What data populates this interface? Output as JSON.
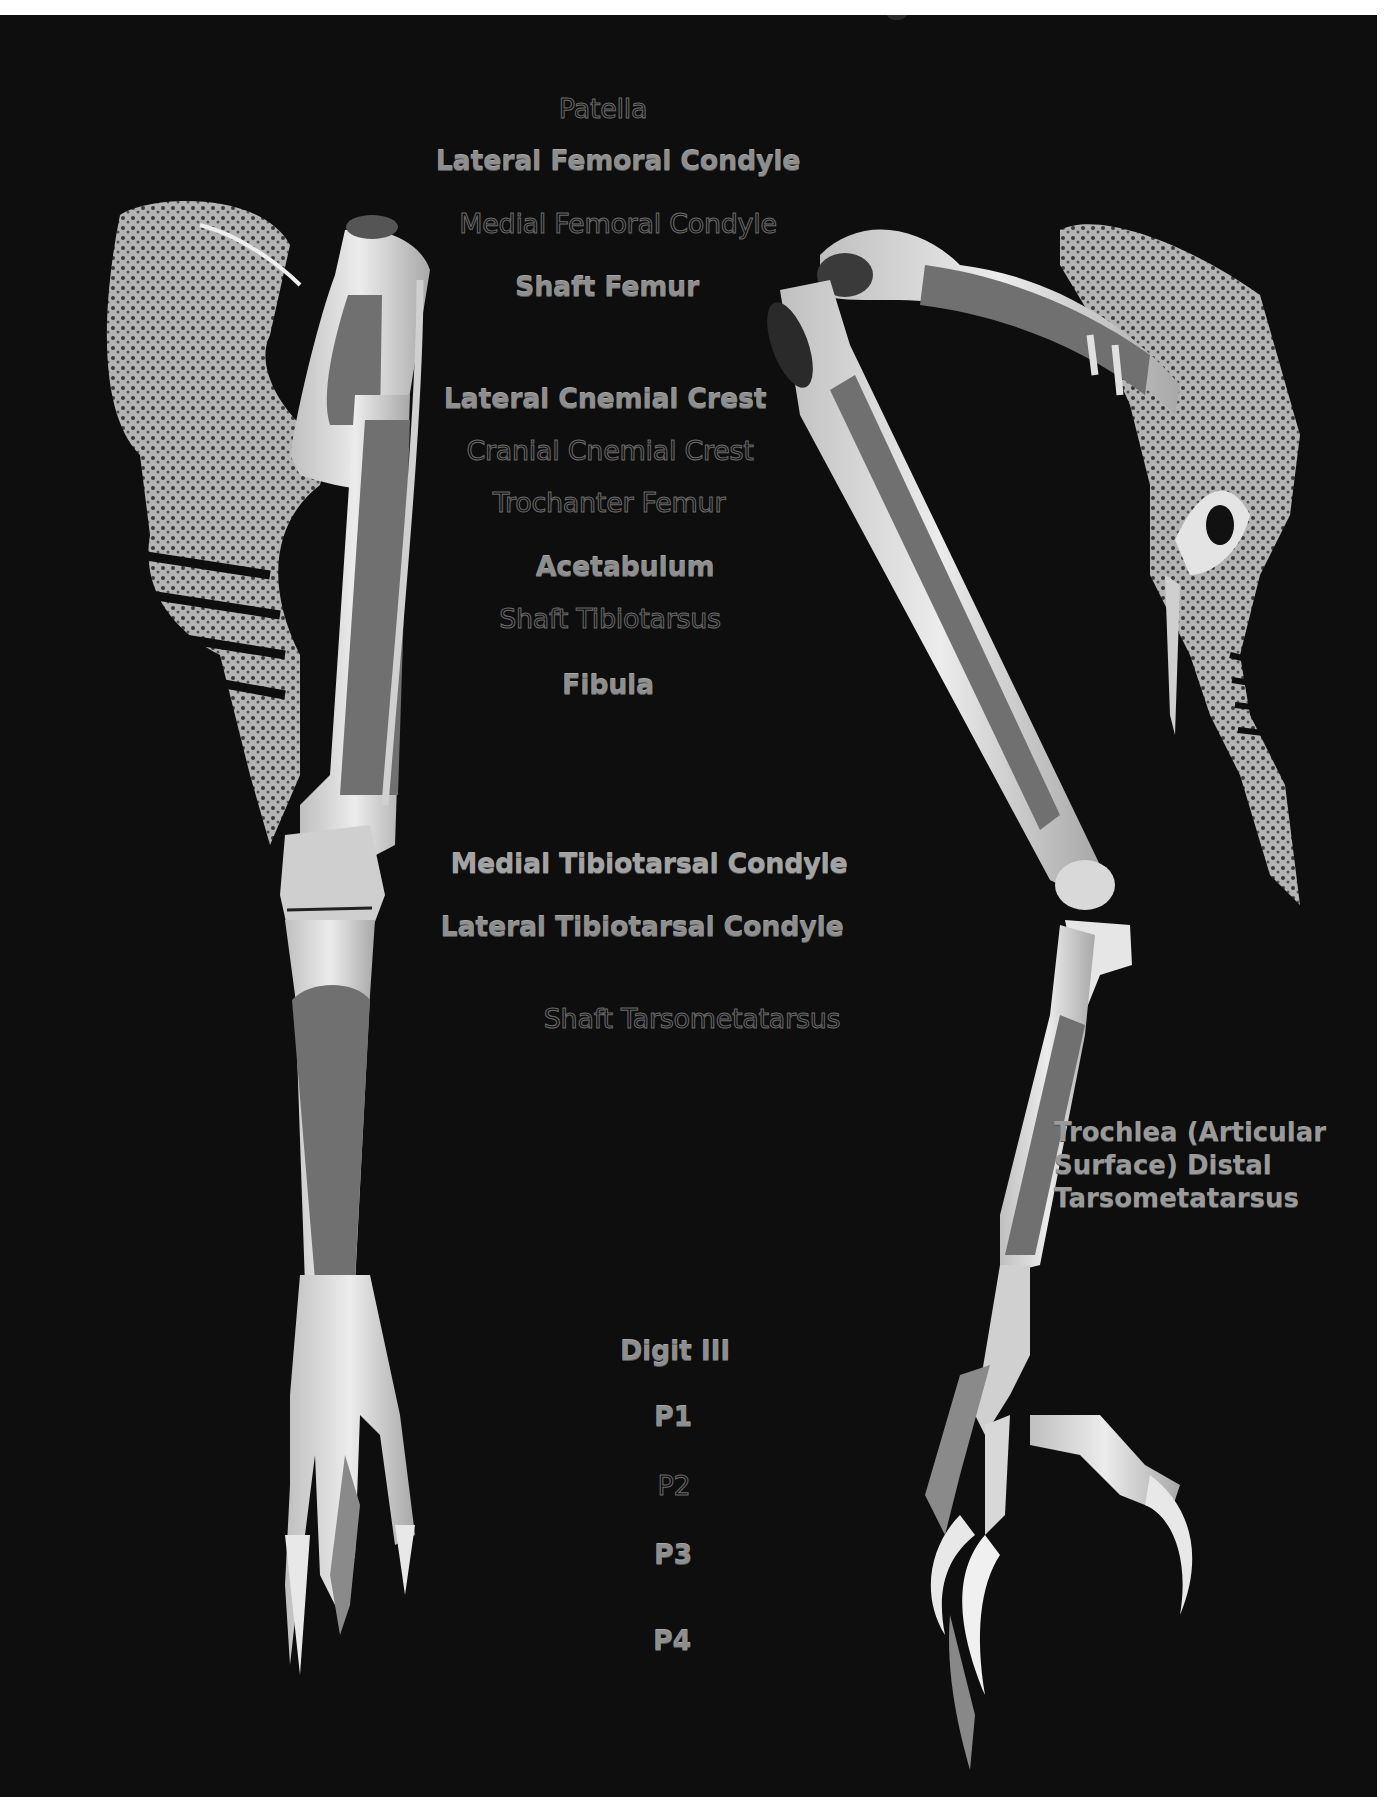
{
  "figure": {
    "colors": {
      "background": "#0e0e0e",
      "page_border": "#ffffff",
      "bone": "#d8d8d8",
      "highlighted_shaft": "#6f6f6f",
      "solid_label": "#8e8e8e",
      "outlined_label_stroke": "#6b6b6b"
    }
  },
  "labels": {
    "patella": "Patella",
    "lateral_femoral_condyle": "Lateral Femoral Condyle",
    "medial_femoral_condyle": "Medial Femoral Condyle",
    "shaft_femur": "Shaft Femur",
    "lateral_cnemial_crest": "Lateral Cnemial Crest",
    "cranial_cnemial_crest": "Cranial Cnemial Crest",
    "trochanter_femur": "Trochanter Femur",
    "acetabulum": "Acetabulum",
    "shaft_tibiotarsus": "Shaft Tibiotarsus",
    "fibula": "Fibula",
    "medial_tibiotarsal_condyle": "Medial Tibiotarsal Condyle",
    "lateral_tibiotarsal_condyle": "Lateral Tibiotarsal Condyle",
    "shaft_tarsometatarsus": "Shaft Tarsometatarsus",
    "digit_iii": "Digit III",
    "p1": "P1",
    "p2": "P2",
    "p3": "P3",
    "p4": "P4",
    "trochlea": {
      "line1": "Trochlea (Articular",
      "line2": "Surface) Distal",
      "line3": "Tarsometatarsus"
    }
  },
  "label_styles": {
    "solid": [
      "Lateral Femoral Condyle",
      "Shaft Femur",
      "Lateral Cnemial Crest",
      "Acetabulum",
      "Fibula",
      "Medial Tibiotarsal Condyle",
      "Lateral Tibiotarsal Condyle",
      "Digit III",
      "P1",
      "P3",
      "P4",
      "Trochlea (Articular Surface) Distal Tarsometatarsus"
    ],
    "outlined": [
      "Patella",
      "Medial Femoral Condyle",
      "Cranial Cnemial Crest",
      "Trochanter Femur",
      "Shaft Tibiotarsus",
      "Shaft Tarsometatarsus",
      "P2"
    ]
  }
}
